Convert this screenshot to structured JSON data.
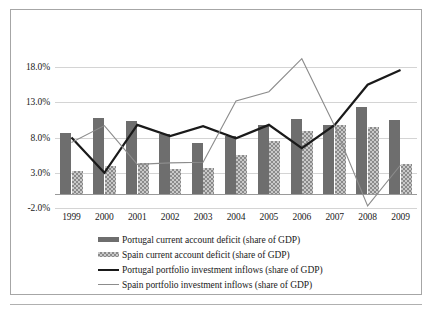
{
  "chart_data": {
    "type": "bar",
    "title": "",
    "xlabel": "",
    "ylabel": "",
    "categories": [
      "1999",
      "2000",
      "2001",
      "2002",
      "2003",
      "2004",
      "2005",
      "2006",
      "2007",
      "2008",
      "2009"
    ],
    "ylim": [
      -2.0,
      20.0
    ],
    "yticks": [
      18.0,
      13.0,
      8.0,
      3.0,
      -2.0
    ],
    "ytick_labels": [
      "18.0%",
      "13.0%",
      "8.0%",
      "3.0%",
      "-2.0%"
    ],
    "grid": true,
    "legend_position": "bottom",
    "series": [
      {
        "name": "Portugal current account deficit (share of GDP)",
        "kind": "bar",
        "color": "#6e6e6e",
        "values": [
          8.7,
          10.8,
          10.3,
          8.5,
          7.2,
          8.2,
          9.8,
          10.7,
          9.8,
          12.4,
          10.5
        ]
      },
      {
        "name": "Spain current account deficit (share of GDP)",
        "kind": "bar",
        "color": "#c9c9c9",
        "values": [
          3.2,
          4.0,
          4.4,
          3.6,
          3.7,
          5.5,
          7.5,
          9.0,
          9.8,
          9.5,
          4.2
        ]
      },
      {
        "name": "Portugal portfolio investment inflows (share of GDP)",
        "kind": "line",
        "color": "#1a1a1a",
        "values": [
          8.0,
          3.0,
          9.8,
          8.2,
          9.6,
          7.9,
          9.8,
          6.5,
          9.8,
          15.5,
          17.6
        ]
      },
      {
        "name": "Spain portfolio investment inflows (share of GDP)",
        "kind": "line",
        "color": "#8c8c8c",
        "values": [
          7.3,
          9.7,
          4.2,
          4.4,
          4.5,
          13.2,
          14.5,
          19.2,
          9.6,
          -1.7,
          4.1
        ]
      }
    ]
  },
  "legend": {
    "items": [
      {
        "label": "Portugal current account deficit (share of GDP)",
        "swatch": "bar-portugal"
      },
      {
        "label": "Spain current account deficit (share of GDP)",
        "swatch": "bar-spain"
      },
      {
        "label": "Portugal portfolio investment inflows (share of GDP)",
        "swatch": "line-portugal"
      },
      {
        "label": "Spain portfolio investment inflows (share of GDP)",
        "swatch": "line-spain"
      }
    ]
  }
}
